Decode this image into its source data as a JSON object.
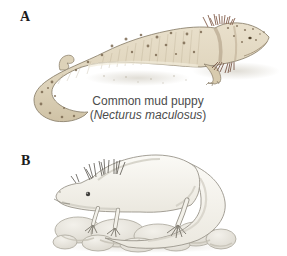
{
  "figure": {
    "panels": [
      {
        "label": "A",
        "illustration": "common mud puppy drawing",
        "caption": {
          "common_name": "Common mud puppy",
          "paren_open": "(",
          "scientific_name": "Necturus maculosus",
          "paren_close": ")"
        }
      },
      {
        "label": "B",
        "illustration": "axolotl on rocks drawing"
      }
    ],
    "colors": {
      "background": "#ffffff",
      "label_color": "#1c1c1c",
      "caption_color": "#4c4c4c",
      "mud_puppy_body": "#e4dac4",
      "mud_puppy_belly": "#efe9d9",
      "mud_puppy_spots": "#7d6b53",
      "mud_puppy_gills": "#84604e",
      "axolotl_body": "#f6f4ee",
      "axolotl_shading": "#cfccc2",
      "rock_fill": "#e9e6de",
      "outline": "#9a958b",
      "shadow": "#dbd7cd"
    }
  }
}
